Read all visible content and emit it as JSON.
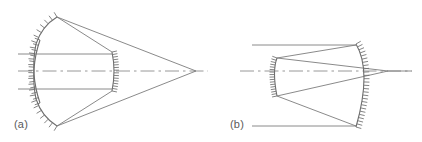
{
  "figure": {
    "background_color": "#ffffff",
    "line_color": "#7d7d7d",
    "mirror_color": "#6e6e6e",
    "axis_color": "#8d8d8d",
    "panels": [
      {
        "id": "a",
        "label": "(a)",
        "label_x": 14,
        "label_y": 128,
        "description": "Cassegrain-style configuration: concave primary mirror at left reflects incoming parallel rays inward to a small secondary mirror near the axis, which sends rays to a focus far to the right on the optical axis.",
        "optical_axis": {
          "x1": 18,
          "y1": 71,
          "x2": 208,
          "y2": 71
        },
        "focus_point": {
          "x": 196,
          "y": 71
        },
        "incoming_rays": [
          {
            "name": "upper-incoming-ray",
            "x1": 18,
            "y1": 54,
            "x2": 112,
            "y2": 54
          },
          {
            "name": "lower-incoming-ray",
            "x1": 18,
            "y1": 89,
            "x2": 112,
            "y2": 89
          }
        ],
        "mirrors": [
          {
            "name": "upper-primary-mirror-segment",
            "type": "concave-arc",
            "hatch_side": "outward-left",
            "path": "M 40 103 Q 30 74 36 44 Q 42 26 57 17",
            "hatch_count": 17,
            "hatch_length": 5.5
          },
          {
            "name": "lower-primary-mirror-segment",
            "type": "concave-arc",
            "hatch_side": "outward-left",
            "path": "M 40 40 Q 30 69 36 99 Q 42 117 57 126",
            "hatch_count": 17,
            "hatch_length": 5.5
          },
          {
            "name": "secondary-mirror",
            "type": "small-convex-arc",
            "hatch_side": "right",
            "path": "M 112 52 Q 116 71 112 91",
            "hatch_count": 15,
            "hatch_length": 5.0
          }
        ],
        "reflected_rays": [
          {
            "name": "upper-vertex-to-secondary-top",
            "x1": 57,
            "y1": 17,
            "x2": 112,
            "y2": 52
          },
          {
            "name": "upper-vertex-to-focus",
            "x1": 57,
            "y1": 17,
            "x2": 196,
            "y2": 71
          },
          {
            "name": "lower-vertex-to-secondary-bottom",
            "x1": 57,
            "y1": 126,
            "x2": 112,
            "y2": 91
          },
          {
            "name": "lower-vertex-to-focus",
            "x1": 57,
            "y1": 126,
            "x2": 196,
            "y2": 71
          }
        ]
      },
      {
        "id": "b",
        "label": "(b)",
        "label_x": 230,
        "label_y": 128,
        "description": "Gregorian-style configuration: incoming parallel rays strike a large concave primary mirror at right, converge toward a small secondary mirror at left near the axis, and are returned to a focus on the optical axis just in front of the primary.",
        "optical_axis": {
          "x1": 240,
          "y1": 71,
          "x2": 412,
          "y2": 71
        },
        "focus_point": {
          "x": 388,
          "y": 71
        },
        "incoming_rays": [
          {
            "name": "upper-incoming-ray",
            "x1": 252,
            "y1": 45,
            "x2": 356,
            "y2": 45
          },
          {
            "name": "lower-incoming-ray",
            "x1": 252,
            "y1": 126,
            "x2": 356,
            "y2": 126
          }
        ],
        "mirrors": [
          {
            "name": "primary-mirror",
            "type": "concave-arc",
            "hatch_side": "outward-right",
            "path": "M 356 44 Q 372 71 356 127",
            "hatch_count": 26,
            "hatch_length": 5.5
          },
          {
            "name": "secondary-mirror",
            "type": "small-concave-arc",
            "hatch_side": "left",
            "path": "M 277 58 Q 272 71 277 96",
            "hatch_count": 16,
            "hatch_length": 5.0
          }
        ],
        "reflected_rays": [
          {
            "name": "primary-top-to-secondary-top",
            "x1": 356,
            "y1": 45,
            "x2": 277,
            "y2": 58
          },
          {
            "name": "primary-bottom-to-secondary-bottom",
            "x1": 356,
            "y1": 126,
            "x2": 277,
            "y2": 96
          },
          {
            "name": "secondary-top-to-focus",
            "x1": 277,
            "y1": 58,
            "x2": 388,
            "y2": 71
          },
          {
            "name": "secondary-bottom-to-focus",
            "x1": 277,
            "y1": 96,
            "x2": 388,
            "y2": 71
          },
          {
            "name": "focus-to-axis-right",
            "x1": 388,
            "y1": 71,
            "x2": 412,
            "y2": 71
          }
        ]
      }
    ]
  }
}
